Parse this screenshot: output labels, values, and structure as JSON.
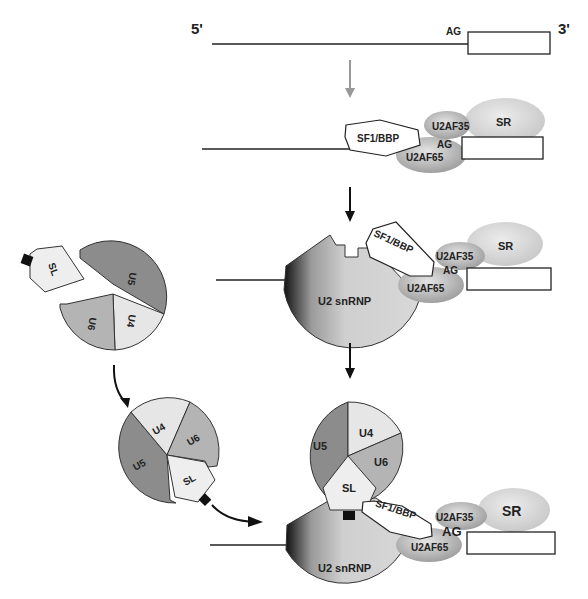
{
  "diagram": {
    "ends": {
      "five_prime": "5'",
      "three_prime": "3'"
    },
    "splice_site": "AG",
    "factors": {
      "sf1": "SF1/BBP",
      "u2af35": "U2AF35",
      "u2af65": "U2AF65",
      "sr": "SR",
      "u2": "U2 snRNP"
    },
    "tri_snrnp": {
      "u4": "U4",
      "u5": "U5",
      "u6": "U6",
      "sl": "SL"
    },
    "colors": {
      "u5": "#8c8c8c",
      "u6": "#b4b4b4",
      "u4": "#e6e6e6",
      "sl": "#eeeeee",
      "sr": "#d2d2d2",
      "u2af": "#a8a8a8",
      "arrow_gray": "#999999",
      "arrow_black": "#111111"
    },
    "steps": [
      {
        "step": 1,
        "label": "Pre-mRNA with AG and exon"
      },
      {
        "step": 2,
        "label": "SF1/BBP, U2AF65, U2AF35, SR bound"
      },
      {
        "step": 3,
        "label": "U2 snRNP joins"
      },
      {
        "step": 4,
        "label": "U4/U5/U6 tri-snRNP with SL joins"
      }
    ]
  }
}
